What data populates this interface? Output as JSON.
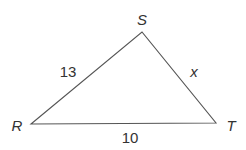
{
  "figure": {
    "type": "triangle",
    "vertices": [
      {
        "name": "R",
        "x": 31,
        "y": 124
      },
      {
        "name": "S",
        "x": 142,
        "y": 32
      },
      {
        "name": "T",
        "x": 216,
        "y": 123
      }
    ],
    "sides": [
      {
        "between": "R-S",
        "label": "13"
      },
      {
        "between": "S-T",
        "label": "x"
      },
      {
        "between": "R-T",
        "label": "10"
      }
    ],
    "stroke_color": "#555555"
  },
  "labels": {
    "vertex_r": "R",
    "vertex_s": "S",
    "vertex_t": "T",
    "side_rs": "13",
    "side_st": "x",
    "side_rt": "10"
  }
}
